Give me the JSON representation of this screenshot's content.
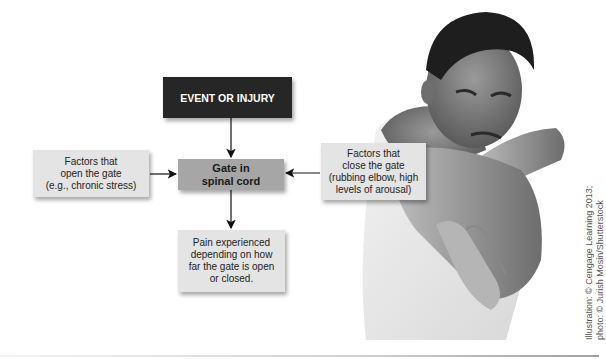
{
  "diagram": {
    "nodes": {
      "event": "EVENT OR INJURY",
      "open_factors": [
        "Factors that",
        "open the gate",
        "(e.g., chronic stress)"
      ],
      "gate": [
        "Gate in",
        "spinal cord"
      ],
      "close_factors": [
        "Factors that",
        "close the gate",
        "(rubbing elbow, high",
        "levels of arousal)"
      ],
      "pain": [
        "Pain experienced",
        "depending on how",
        "far the gate is open",
        "or closed."
      ]
    },
    "edges": [
      {
        "from": "event",
        "to": "gate"
      },
      {
        "from": "open_factors",
        "to": "gate"
      },
      {
        "from": "close_factors",
        "to": "gate"
      },
      {
        "from": "gate",
        "to": "pain"
      }
    ]
  },
  "photo": {
    "description": "Man grimacing in pain holding his elbow",
    "icon": "photo-person-elbow-pain"
  },
  "credit": {
    "line1": "Illustration: © Cengage Learning 2013;",
    "line2": "photo: © Jurish Mosin/Shutterstock"
  },
  "colors": {
    "event_box": "#262626",
    "gate_box": "#a6a6a6",
    "factor_box": "#e4e4e4"
  }
}
